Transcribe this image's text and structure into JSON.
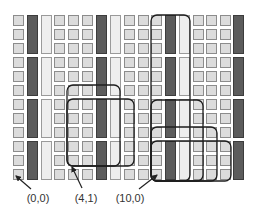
{
  "diagram": {
    "colors": {
      "background": "#ffffff",
      "cell_fill": "#dcdcdc",
      "cell_stroke": "#8c8c8c",
      "dark_bar_fill": "#5c5c5c",
      "dark_bar_stroke": "#3c3c3c",
      "light_bar_fill": "#eeeeee",
      "light_bar_stroke": "#9a9a9a",
      "outline_stroke": "#1e1e1e",
      "arrow": "#222222"
    },
    "grid": {
      "columns": 17,
      "rows": 12,
      "row_groups": 4,
      "rows_per_group": 3,
      "column_types": [
        "cell",
        "dark",
        "light",
        "cell",
        "cell",
        "cell",
        "dark",
        "light",
        "cell",
        "cell",
        "cell",
        "dark",
        "light",
        "cell",
        "cell",
        "cell",
        "dark"
      ],
      "column_x": [
        13,
        27,
        41,
        54,
        68,
        82,
        96,
        110,
        124,
        138,
        151,
        165,
        179,
        193,
        206,
        220,
        233
      ],
      "row_y": [
        15,
        29,
        43,
        57,
        71,
        85,
        99,
        113,
        127,
        141,
        155,
        169
      ],
      "cell_size": 11
    },
    "outlines": [
      {
        "id": "A",
        "x1": 67,
        "y1": 85,
        "x2": 120,
        "y2": 166
      },
      {
        "id": "B",
        "x1": 67,
        "y1": 99,
        "x2": 134,
        "y2": 166
      },
      {
        "id": "C",
        "x1": 151,
        "y1": 15,
        "x2": 190,
        "y2": 181
      },
      {
        "id": "F",
        "x1": 151,
        "y1": 100,
        "x2": 203,
        "y2": 181
      },
      {
        "id": "D",
        "x1": 151,
        "y1": 127,
        "x2": 217,
        "y2": 181
      },
      {
        "id": "E",
        "x1": 151,
        "y1": 141,
        "x2": 231,
        "y2": 181
      }
    ],
    "labels": [
      {
        "text": "(0,0)",
        "x": 38,
        "y": 192,
        "arrow_from": [
          31,
          189
        ],
        "arrow_to": [
          16,
          176
        ]
      },
      {
        "text": "(4,1)",
        "x": 86,
        "y": 192,
        "arrow_from": [
          82,
          188
        ],
        "arrow_to": [
          72,
          167
        ]
      },
      {
        "text": "(10,0)",
        "x": 130,
        "y": 192,
        "arrow_from": [
          139,
          189
        ],
        "arrow_to": [
          157,
          175
        ]
      }
    ]
  }
}
